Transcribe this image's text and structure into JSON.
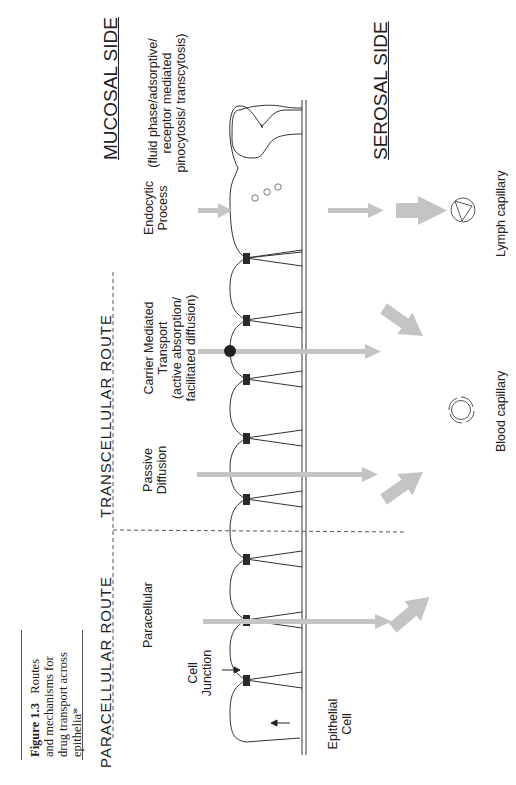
{
  "figure": {
    "number": "Figure 1.3",
    "caption_rest": "Routes and mechanisms for drug transport across epithelia*",
    "caption_lines": [
      "Routes",
      "and mechanisms for",
      "drug transport across",
      "epithelia*"
    ]
  },
  "sides": {
    "mucosal": "MUCOSAL SIDE",
    "serosal": "SEROSAL SIDE"
  },
  "routes": {
    "paracellular": "PARACELLULAR ROUTE",
    "transcellular": "TRANSCELLULAR ROUTE"
  },
  "mechanisms": {
    "paracellular": "Paracellular",
    "passive": [
      "Passive",
      "Diffusion"
    ],
    "carrier": [
      "Carrier Mediated",
      "Transport",
      "(active absorption/",
      "facilitated diffusion)"
    ],
    "endocytic": [
      "Endocytic",
      "Process"
    ],
    "endocytic_detail": [
      "(fluid phase/adsorptive/",
      "receptor mediated",
      "pinocytosis/ transcytosis)"
    ]
  },
  "structures": {
    "cell_junction": [
      "Cell",
      "Junction"
    ],
    "epithelial_cell": [
      "Epithelial",
      "Cell"
    ],
    "blood_capillary": "Blood capillary",
    "lymph_capillary": "Lymph capillary"
  },
  "colors": {
    "arrow_gray": "#c4c4c4",
    "line": "#333333",
    "junction": "#2a2a2a"
  }
}
